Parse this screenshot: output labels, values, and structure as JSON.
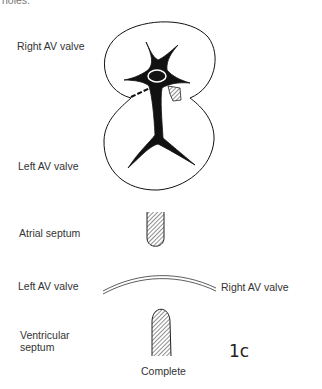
{
  "header": {
    "cropped_text": "holes."
  },
  "labels": {
    "right_av_valve_top": "Right AV valve",
    "left_av_valve_mid": "Left AV valve",
    "atrial_septum": "Atrial septum",
    "left_av_valve_bottom": "Left AV valve",
    "right_av_valve_bottom": "Right AV valve",
    "ventricular_septum_line1": "Ventricular",
    "ventricular_septum_line2": "septum",
    "caption": "Complete",
    "figure_id": "1c"
  },
  "colors": {
    "ink": "#111111",
    "text": "#333333",
    "background": "#ffffff"
  }
}
